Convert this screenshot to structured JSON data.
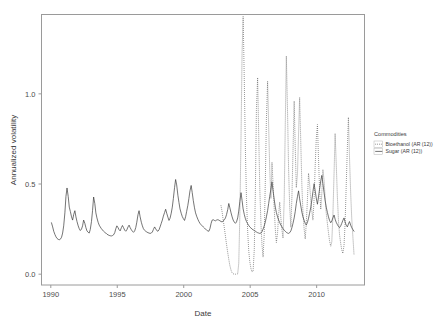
{
  "chart_data": {
    "type": "line",
    "title": "",
    "xlabel": "Date",
    "ylabel": "Annualized volatility",
    "xlim": [
      1989.3,
      2013.6
    ],
    "ylim": [
      -0.06,
      1.44
    ],
    "xticks": [
      1990,
      1995,
      2000,
      2005,
      2010
    ],
    "xtick_labels": [
      "1990",
      "1995",
      "2000",
      "2005",
      "2010"
    ],
    "yticks": [
      0.0,
      0.5,
      1.0
    ],
    "ytick_labels": [
      "0.0",
      "0.5",
      "1.0"
    ],
    "grid": false,
    "legend": {
      "title": "Commodities",
      "position": "right",
      "entries": [
        {
          "name": "Bioethanol (AR (12))",
          "style": "dotted",
          "color": "#5a5a5a"
        },
        {
          "name": "Sugar (AR (12))",
          "style": "solid",
          "color": "#3a3a3a"
        }
      ]
    },
    "series": [
      {
        "name": "Sugar (AR (12))",
        "style": "solid",
        "color": "#3a3a3a",
        "x": [
          1990.05,
          1990.14,
          1990.22,
          1990.31,
          1990.39,
          1990.47,
          1990.56,
          1990.64,
          1990.72,
          1990.81,
          1990.89,
          1990.97,
          1991.06,
          1991.14,
          1991.22,
          1991.31,
          1991.39,
          1991.47,
          1991.56,
          1991.64,
          1991.72,
          1991.81,
          1991.89,
          1991.97,
          1992.06,
          1992.14,
          1992.22,
          1992.31,
          1992.39,
          1992.47,
          1992.56,
          1992.64,
          1992.72,
          1992.81,
          1992.89,
          1992.97,
          1993.06,
          1993.14,
          1993.22,
          1993.31,
          1993.39,
          1993.47,
          1993.56,
          1993.64,
          1993.72,
          1993.81,
          1993.89,
          1993.97,
          1994.06,
          1994.14,
          1994.22,
          1994.31,
          1994.39,
          1994.47,
          1994.56,
          1994.64,
          1994.72,
          1994.81,
          1994.89,
          1994.97,
          1995.06,
          1995.14,
          1995.22,
          1995.31,
          1995.39,
          1995.47,
          1995.56,
          1995.64,
          1995.72,
          1995.81,
          1995.89,
          1995.97,
          1996.06,
          1996.14,
          1996.22,
          1996.31,
          1996.39,
          1996.47,
          1996.56,
          1996.64,
          1996.72,
          1996.81,
          1996.89,
          1996.97,
          1997.06,
          1997.14,
          1997.22,
          1997.31,
          1997.39,
          1997.47,
          1997.56,
          1997.64,
          1997.72,
          1997.81,
          1997.89,
          1997.97,
          1998.06,
          1998.14,
          1998.22,
          1998.31,
          1998.39,
          1998.47,
          1998.56,
          1998.64,
          1998.72,
          1998.81,
          1998.89,
          1998.97,
          1999.06,
          1999.14,
          1999.22,
          1999.31,
          1999.39,
          1999.47,
          1999.56,
          1999.64,
          1999.72,
          1999.81,
          1999.89,
          1999.97,
          2000.06,
          2000.14,
          2000.22,
          2000.31,
          2000.39,
          2000.47,
          2000.56,
          2000.64,
          2000.72,
          2000.81,
          2000.89,
          2000.97,
          2001.06,
          2001.14,
          2001.22,
          2001.31,
          2001.39,
          2001.47,
          2001.56,
          2001.64,
          2001.72,
          2001.81,
          2001.89,
          2001.97,
          2002.06,
          2002.14,
          2002.22,
          2002.31,
          2002.39,
          2002.47,
          2002.56,
          2002.64,
          2002.72,
          2002.81,
          2002.89,
          2002.97,
          2003.06,
          2003.14,
          2003.22,
          2003.31,
          2003.39,
          2003.47,
          2003.56,
          2003.64,
          2003.72,
          2003.81,
          2003.89,
          2003.97,
          2004.06,
          2004.14,
          2004.22,
          2004.31,
          2004.39,
          2004.47,
          2004.56,
          2004.64,
          2004.72,
          2004.81,
          2004.89,
          2004.97,
          2005.06,
          2005.14,
          2005.22,
          2005.31,
          2005.39,
          2005.47,
          2005.56,
          2005.64,
          2005.72,
          2005.81,
          2005.89,
          2005.97,
          2006.06,
          2006.14,
          2006.22,
          2006.31,
          2006.39,
          2006.47,
          2006.56,
          2006.64,
          2006.72,
          2006.81,
          2006.89,
          2006.97,
          2007.06,
          2007.14,
          2007.22,
          2007.31,
          2007.39,
          2007.47,
          2007.56,
          2007.64,
          2007.72,
          2007.81,
          2007.89,
          2007.97,
          2008.06,
          2008.14,
          2008.22,
          2008.31,
          2008.39,
          2008.47,
          2008.56,
          2008.64,
          2008.72,
          2008.81,
          2008.89,
          2008.97,
          2009.06,
          2009.14,
          2009.22,
          2009.31,
          2009.39,
          2009.47,
          2009.56,
          2009.64,
          2009.72,
          2009.81,
          2009.89,
          2009.97,
          2010.06,
          2010.14,
          2010.22,
          2010.31,
          2010.39,
          2010.47,
          2010.56,
          2010.64,
          2010.72,
          2010.81,
          2010.89,
          2010.97,
          2011.06,
          2011.14,
          2011.22,
          2011.31,
          2011.39,
          2011.47,
          2011.56,
          2011.64,
          2011.72,
          2011.81,
          2011.89,
          2011.97,
          2012.06,
          2012.14,
          2012.22,
          2012.31,
          2012.39,
          2012.47,
          2012.56,
          2012.64,
          2012.72,
          2012.81
        ],
        "y": [
          0.285,
          0.262,
          0.238,
          0.22,
          0.207,
          0.198,
          0.193,
          0.191,
          0.194,
          0.205,
          0.228,
          0.268,
          0.34,
          0.432,
          0.478,
          0.43,
          0.372,
          0.348,
          0.318,
          0.3,
          0.33,
          0.352,
          0.318,
          0.292,
          0.268,
          0.252,
          0.242,
          0.25,
          0.268,
          0.3,
          0.282,
          0.258,
          0.24,
          0.232,
          0.228,
          0.248,
          0.292,
          0.352,
          0.428,
          0.392,
          0.34,
          0.312,
          0.288,
          0.272,
          0.262,
          0.252,
          0.245,
          0.238,
          0.232,
          0.228,
          0.222,
          0.218,
          0.215,
          0.213,
          0.212,
          0.214,
          0.218,
          0.23,
          0.252,
          0.268,
          0.258,
          0.246,
          0.24,
          0.258,
          0.27,
          0.258,
          0.244,
          0.238,
          0.246,
          0.262,
          0.272,
          0.258,
          0.246,
          0.238,
          0.232,
          0.24,
          0.258,
          0.288,
          0.33,
          0.352,
          0.318,
          0.288,
          0.268,
          0.252,
          0.243,
          0.238,
          0.234,
          0.23,
          0.228,
          0.226,
          0.228,
          0.234,
          0.248,
          0.262,
          0.252,
          0.242,
          0.238,
          0.246,
          0.262,
          0.282,
          0.3,
          0.322,
          0.342,
          0.36,
          0.338,
          0.316,
          0.298,
          0.31,
          0.338,
          0.372,
          0.42,
          0.48,
          0.525,
          0.495,
          0.438,
          0.398,
          0.362,
          0.338,
          0.32,
          0.308,
          0.298,
          0.318,
          0.348,
          0.382,
          0.42,
          0.462,
          0.492,
          0.452,
          0.408,
          0.368,
          0.34,
          0.322,
          0.305,
          0.292,
          0.282,
          0.274,
          0.268,
          0.262,
          0.256,
          0.25,
          0.244,
          0.24,
          0.238,
          0.252,
          0.282,
          0.3,
          0.302,
          0.298,
          0.296,
          0.3,
          0.302,
          0.3,
          0.296,
          0.292,
          0.29,
          0.295,
          0.302,
          0.312,
          0.33,
          0.358,
          0.392,
          0.368,
          0.34,
          0.318,
          0.3,
          0.288,
          0.282,
          0.29,
          0.312,
          0.35,
          0.402,
          0.452,
          0.408,
          0.362,
          0.33,
          0.308,
          0.292,
          0.28,
          0.27,
          0.262,
          0.256,
          0.25,
          0.246,
          0.242,
          0.238,
          0.234,
          0.23,
          0.228,
          0.226,
          0.228,
          0.236,
          0.25,
          0.268,
          0.29,
          0.318,
          0.352,
          0.392,
          0.432,
          0.472,
          0.512,
          0.462,
          0.412,
          0.372,
          0.342,
          0.318,
          0.3,
          0.286,
          0.272,
          0.262,
          0.252,
          0.244,
          0.238,
          0.232,
          0.228,
          0.226,
          0.23,
          0.24,
          0.258,
          0.282,
          0.312,
          0.348,
          0.392,
          0.432,
          0.462,
          0.418,
          0.378,
          0.344,
          0.318,
          0.298,
          0.282,
          0.272,
          0.288,
          0.31,
          0.338,
          0.372,
          0.412,
          0.458,
          0.502,
          0.462,
          0.422,
          0.388,
          0.428,
          0.472,
          0.518,
          0.548,
          0.502,
          0.452,
          0.408,
          0.372,
          0.342,
          0.318,
          0.298,
          0.285,
          0.295,
          0.312,
          0.328,
          0.305,
          0.288,
          0.275,
          0.265,
          0.258,
          0.268,
          0.282,
          0.298,
          0.312,
          0.29,
          0.272,
          0.262,
          0.278,
          0.292,
          0.272,
          0.258,
          0.248,
          0.238
        ]
      },
      {
        "name": "Bioethanol (AR (12))",
        "style": "dotted",
        "color": "#5a5a5a",
        "x": [
          2002.8,
          2002.89,
          2002.97,
          2003.06,
          2003.14,
          2003.22,
          2003.31,
          2003.39,
          2003.47,
          2003.56,
          2003.64,
          2003.72,
          2003.81,
          2003.89,
          2003.97,
          2004.06,
          2004.14,
          2004.22,
          2004.31,
          2004.39,
          2004.47,
          2004.56,
          2004.64,
          2004.72,
          2004.81,
          2004.89,
          2004.97,
          2005.06,
          2005.14,
          2005.22,
          2005.31,
          2005.39,
          2005.47,
          2005.56,
          2005.64,
          2005.72,
          2005.81,
          2005.89,
          2005.97,
          2006.06,
          2006.14,
          2006.22,
          2006.31,
          2006.39,
          2006.47,
          2006.56,
          2006.64,
          2006.72,
          2006.81,
          2006.89,
          2006.97,
          2007.06,
          2007.14,
          2007.22,
          2007.31,
          2007.39,
          2007.47,
          2007.56,
          2007.64,
          2007.72,
          2007.81,
          2007.89,
          2007.97,
          2008.06,
          2008.14,
          2008.22,
          2008.31,
          2008.39,
          2008.47,
          2008.56,
          2008.64,
          2008.72,
          2008.81,
          2008.89,
          2008.97,
          2009.06,
          2009.14,
          2009.22,
          2009.31,
          2009.39,
          2009.47,
          2009.56,
          2009.64,
          2009.72,
          2009.81,
          2009.89,
          2009.97,
          2010.06,
          2010.14,
          2010.22,
          2010.31,
          2010.39,
          2010.47,
          2010.56,
          2010.64,
          2010.72,
          2010.81,
          2010.89,
          2010.97,
          2011.06,
          2011.14,
          2011.22,
          2011.31,
          2011.39,
          2011.47,
          2011.56,
          2011.64,
          2011.72,
          2011.81,
          2011.89,
          2011.97,
          2012.06,
          2012.14,
          2012.22,
          2012.31,
          2012.39,
          2012.47,
          2012.56,
          2012.64,
          2012.72,
          2012.81
        ],
        "y": [
          0.382,
          0.345,
          0.3,
          0.255,
          0.21,
          0.165,
          0.12,
          0.082,
          0.048,
          0.022,
          0.008,
          0.002,
          0.0,
          0.0,
          0.0,
          0.002,
          0.06,
          0.32,
          0.76,
          1.23,
          1.43,
          1.06,
          0.69,
          0.42,
          0.24,
          0.13,
          0.07,
          0.03,
          0.012,
          0.018,
          0.14,
          0.46,
          0.92,
          1.09,
          0.78,
          0.48,
          0.28,
          0.16,
          0.095,
          0.23,
          0.52,
          0.86,
          1.07,
          0.82,
          0.58,
          0.42,
          0.62,
          0.5,
          0.36,
          0.25,
          0.175,
          0.23,
          0.33,
          0.4,
          0.31,
          0.245,
          0.2,
          0.42,
          0.83,
          1.21,
          0.9,
          0.58,
          0.38,
          0.26,
          0.43,
          0.68,
          0.96,
          0.7,
          0.48,
          0.56,
          0.78,
          0.98,
          0.72,
          0.49,
          0.34,
          0.25,
          0.195,
          0.28,
          0.42,
          0.56,
          0.5,
          0.41,
          0.35,
          0.3,
          0.42,
          0.6,
          0.75,
          0.83,
          0.64,
          0.47,
          0.36,
          0.45,
          0.58,
          0.52,
          0.42,
          0.34,
          0.28,
          0.23,
          0.185,
          0.155,
          0.18,
          0.32,
          0.56,
          0.78,
          0.62,
          0.43,
          0.3,
          0.22,
          0.17,
          0.135,
          0.115,
          0.16,
          0.28,
          0.48,
          0.7,
          0.87,
          0.65,
          0.45,
          0.31,
          0.215,
          0.11
        ]
      }
    ]
  }
}
